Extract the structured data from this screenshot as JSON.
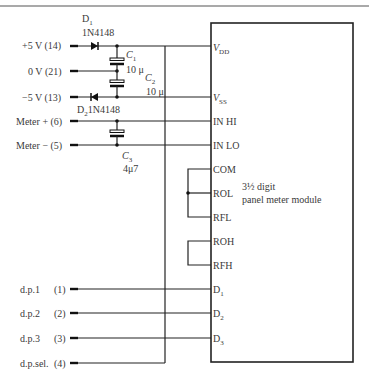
{
  "diagram": {
    "type": "circuit-schematic",
    "module": {
      "label_line1": "3½ digit",
      "label_line2": "panel meter module"
    },
    "inputs": [
      {
        "name": "+5 V",
        "pin": "(14)"
      },
      {
        "name": "0 V",
        "pin": "(21)"
      },
      {
        "name": "−5 V",
        "pin": "(13)"
      },
      {
        "name": "Meter  + ",
        "pin": "(6)"
      },
      {
        "name": "Meter  − ",
        "pin": "(5)"
      },
      {
        "name": "d.p.1",
        "pin": "(1)"
      },
      {
        "name": "d.p.2",
        "pin": "(2)"
      },
      {
        "name": "d.p.3",
        "pin": "(3)"
      },
      {
        "name": "d.p.sel.",
        "pin": "(4)"
      }
    ],
    "module_pins": {
      "vdd": {
        "main": "V",
        "sub": "DD"
      },
      "vss": {
        "main": "V",
        "sub": "SS"
      },
      "in_hi": "IN HI",
      "in_lo": "IN LO",
      "com": "COM",
      "rol": "ROL",
      "rfl": "RFL",
      "roh": "ROH",
      "rfh": "RFH",
      "d1": {
        "main": "D",
        "sub": "1"
      },
      "d2": {
        "main": "D",
        "sub": "2"
      },
      "d3": {
        "main": "D",
        "sub": "3"
      }
    },
    "components": {
      "d1": {
        "ref": "D",
        "sub": "1",
        "part": "1N4148"
      },
      "d2": {
        "ref": "D",
        "sub": "2",
        "part": "1N4148"
      },
      "c1": {
        "ref": "C",
        "sub": "1",
        "value": "10 μ"
      },
      "c2": {
        "ref": "C",
        "sub": "2",
        "value": "10 μ"
      },
      "c3": {
        "ref": "C",
        "sub": "3",
        "value": "4μ7"
      }
    }
  }
}
